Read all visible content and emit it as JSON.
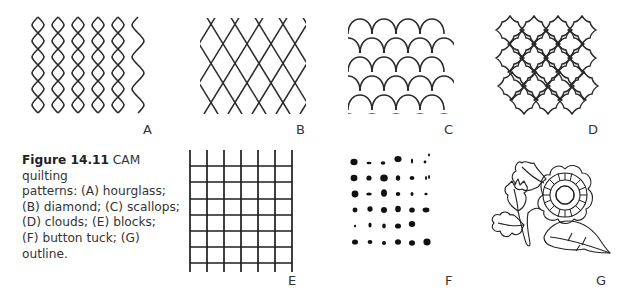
{
  "figure": {
    "number": "Figure 14.11",
    "caption_text": "CAM quilting patterns: (A) hourglass; (B) diamond; (C) scallops; (D) clouds; (E) blocks; (F) button tuck; (G) outline.",
    "caption_lines": [
      "CAM quilting",
      "patterns: (A) hourglass;",
      "(B) diamond; (C) scallops;",
      "(D) clouds; (E) blocks;",
      "(F) button tuck; (G) outline."
    ]
  },
  "panels": [
    {
      "letter": "A",
      "name": "hourglass"
    },
    {
      "letter": "B",
      "name": "diamond"
    },
    {
      "letter": "C",
      "name": "scallops"
    },
    {
      "letter": "D",
      "name": "clouds"
    },
    {
      "letter": "E",
      "name": "blocks"
    },
    {
      "letter": "F",
      "name": "button tuck"
    },
    {
      "letter": "G",
      "name": "outline"
    }
  ],
  "colors": {
    "line": "#2a2a2a",
    "text": "#333333",
    "background": "#ffffff"
  }
}
